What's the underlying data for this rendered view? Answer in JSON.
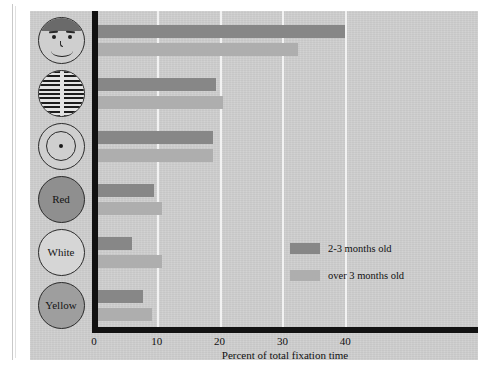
{
  "chart_data": {
    "type": "bar",
    "orientation": "horizontal",
    "title": "",
    "xlabel": "Percent of total fixation time",
    "ylabel": "",
    "xlim": [
      0,
      54
    ],
    "xticks": [
      0,
      10,
      20,
      30,
      40
    ],
    "xtick_labels": [
      "0",
      "10",
      "20",
      "30",
      "40"
    ],
    "grid": "vertical white gridlines at x ticks",
    "legend_position": "center-right inside plot",
    "categories": [
      "face",
      "stripes",
      "bullseye",
      "Red",
      "White",
      "Yellow"
    ],
    "category_labels": [
      "",
      "",
      "",
      "Red",
      "White",
      "Yellow"
    ],
    "category_icons": [
      "face-icon",
      "stripes-circle-icon",
      "bullseye-icon",
      "red-disc-icon",
      "white-disc-icon",
      "yellow-disc-icon"
    ],
    "series": [
      {
        "name": "2-3 months old",
        "color": "#878787",
        "values": [
          40.0,
          19.5,
          19.0,
          9.5,
          6.0,
          7.8
        ]
      },
      {
        "name": "over 3 months old",
        "color": "#aeaeae",
        "values": [
          32.5,
          20.5,
          19.0,
          10.8,
          10.8,
          9.3
        ]
      }
    ]
  },
  "axis": {
    "xlabel": "Percent of total fixation time",
    "ticks": [
      {
        "value": 0,
        "label": "0"
      },
      {
        "value": 10,
        "label": "10"
      },
      {
        "value": 20,
        "label": "20"
      },
      {
        "value": 30,
        "label": "30"
      },
      {
        "value": 40,
        "label": "40"
      }
    ]
  },
  "legend": {
    "items": [
      {
        "label": "2-3 months old",
        "color": "#878787"
      },
      {
        "label": "over 3 months old",
        "color": "#aeaeae"
      }
    ]
  },
  "icons": {
    "red_label": "Red",
    "white_label": "White",
    "yellow_label": "Yellow"
  },
  "colors": {
    "panel_background": "#cfcfcf",
    "axis": "#121212",
    "gridline": "#f2f2f2",
    "series_young": "#878787",
    "series_older": "#aeaeae"
  }
}
